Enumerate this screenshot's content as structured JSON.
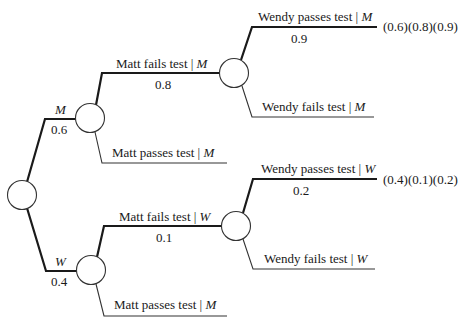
{
  "diagram": {
    "type": "probability-tree",
    "colors": {
      "line": "#1a1a1a",
      "thin_line": "#333333",
      "background": "#ffffff"
    },
    "root": {
      "id": "root"
    },
    "level1": [
      {
        "id": "M",
        "label": "M",
        "prob": "0.6",
        "emphasized": true
      },
      {
        "id": "W",
        "label": "W",
        "prob": "0.4",
        "emphasized": true
      }
    ],
    "level2": [
      {
        "id": "M-fail",
        "parent": "M",
        "label_main": "Matt fails test ",
        "bar": "|",
        "label_cond": " M",
        "prob": "0.8",
        "emphasized": true
      },
      {
        "id": "M-pass",
        "parent": "M",
        "label_main": "Matt passes test ",
        "bar": "|",
        "label_cond": " M",
        "prob": "",
        "emphasized": false
      },
      {
        "id": "W-fail",
        "parent": "W",
        "label_main": "Matt fails test ",
        "bar": "|",
        "label_cond": " W",
        "prob": "0.1",
        "emphasized": true
      },
      {
        "id": "W-pass",
        "parent": "W",
        "label_main": "Matt passes test ",
        "bar": "|",
        "label_cond": " M",
        "prob": "",
        "emphasized": false
      }
    ],
    "level3": [
      {
        "id": "M-fail-wpass",
        "parent": "M-fail",
        "label_main": "Wendy passes test ",
        "bar": "|",
        "label_cond": " M",
        "prob": "0.9",
        "emphasized": true,
        "product": "(0.6)(0.8)(0.9)"
      },
      {
        "id": "M-fail-wfail",
        "parent": "M-fail",
        "label_main": "Wendy fails test ",
        "bar": "|",
        "label_cond": " M",
        "prob": "",
        "emphasized": false,
        "product": ""
      },
      {
        "id": "W-fail-wpass",
        "parent": "W-fail",
        "label_main": "Wendy passes test ",
        "bar": "|",
        "label_cond": " W",
        "prob": "0.2",
        "emphasized": true,
        "product": "(0.4)(0.1)(0.2)"
      },
      {
        "id": "W-fail-wfail",
        "parent": "W-fail",
        "label_main": "Wendy fails test ",
        "bar": "|",
        "label_cond": " W",
        "prob": "",
        "emphasized": false,
        "product": ""
      }
    ]
  }
}
